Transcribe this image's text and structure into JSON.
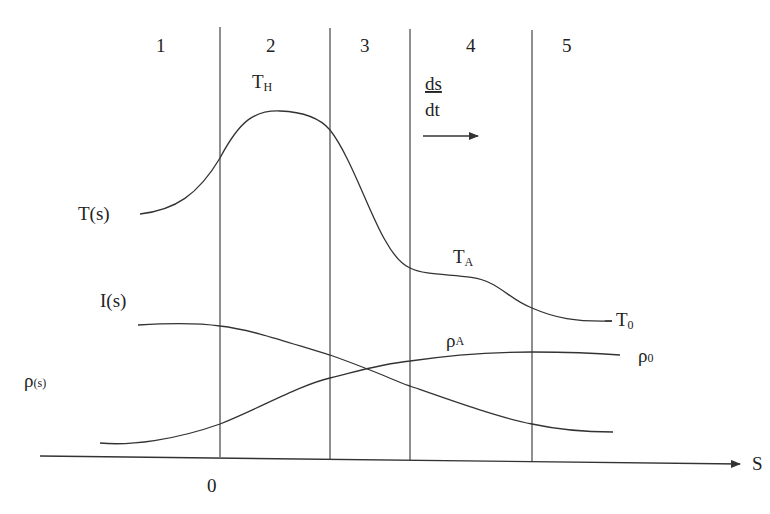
{
  "diagram": {
    "zones": [
      {
        "label": "1",
        "x": 162
      },
      {
        "label": "2",
        "x": 272
      },
      {
        "label": "3",
        "x": 366
      },
      {
        "label": "4",
        "x": 472
      },
      {
        "label": "5",
        "x": 568
      }
    ],
    "zone_dividers_x": [
      220,
      330,
      410,
      530
    ],
    "axis": {
      "label": "S",
      "origin_label": "0"
    },
    "rate": {
      "numerator": "ds",
      "denominator": "dt",
      "arrow": "right-arrow"
    },
    "curves": {
      "temperature": {
        "label_main": "T",
        "label_arg": "(s)",
        "peak_label_main": "T",
        "peak_label_sub": "H",
        "plateau_label_main": "T",
        "plateau_label_sub": "A",
        "end_label_main": "T",
        "end_label_sub": "0"
      },
      "intensity": {
        "label_main": "I",
        "label_arg": "(s)"
      },
      "density": {
        "label_main": "ρ",
        "label_arg": "(s)",
        "mid_label_main": "ρ",
        "mid_label_sub": "A",
        "end_label_main": "ρ",
        "end_label_sub": "0"
      }
    },
    "colors": {
      "ink": "#333333",
      "background": "#ffffff"
    }
  }
}
